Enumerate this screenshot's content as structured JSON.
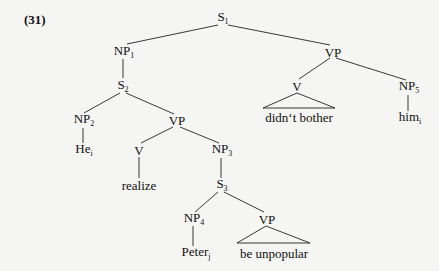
{
  "example_number": "(31)",
  "nodes": {
    "s1": {
      "label": "S",
      "sub": "1"
    },
    "np1": {
      "label": "NP",
      "sub": "1"
    },
    "s2": {
      "label": "S",
      "sub": "2"
    },
    "np2": {
      "label": "NP",
      "sub": "2"
    },
    "vp_inner": {
      "label": "VP",
      "sub": ""
    },
    "vp_main": {
      "label": "VP",
      "sub": ""
    },
    "v_main": {
      "label": "V",
      "sub": ""
    },
    "np5": {
      "label": "NP",
      "sub": "5"
    },
    "didnt_bother": {
      "label": "didn‘t bother",
      "sub": ""
    },
    "him": {
      "label": "him",
      "sub": "i"
    },
    "he": {
      "label": "He",
      "sub": "i"
    },
    "v_inner": {
      "label": "V",
      "sub": ""
    },
    "np3": {
      "label": "NP",
      "sub": "3"
    },
    "realize": {
      "label": "realize",
      "sub": ""
    },
    "s3": {
      "label": "S",
      "sub": "3"
    },
    "np4": {
      "label": "NP",
      "sub": "4"
    },
    "vp_low": {
      "label": "VP",
      "sub": ""
    },
    "peter": {
      "label": "Peter",
      "sub": "j"
    },
    "be_unpopular": {
      "label": "be unpopular",
      "sub": ""
    }
  }
}
